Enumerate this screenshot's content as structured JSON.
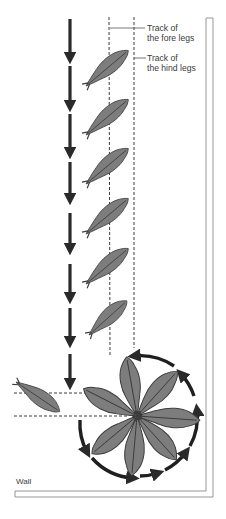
{
  "diagram": {
    "type": "lizard-locomotion-tracks",
    "labels": {
      "fore_track_line1": "Track of",
      "fore_track_line2": "the fore legs",
      "hind_track_line1": "Track of",
      "hind_track_line2": "the hind legs",
      "wall": "Wall"
    },
    "colors": {
      "lizard_fill": "#7d7d7d",
      "lizard_outline": "#3c3c3c",
      "arrow": "#2a2a2a",
      "dashed_line": "#3a3a3a",
      "wall_line": "#8a8a8a",
      "background": "#ffffff"
    },
    "elements": {
      "straight_path_lizards": 6,
      "rosette_lizards": 7,
      "entering_lizard": 1,
      "direction_arrows_column": 8,
      "circular_arrow_segments": 8
    },
    "icons": {
      "lizard": "lizard-silhouette",
      "arrow": "arrow-down",
      "circle_arrow": "clockwise-arc-arrow"
    }
  }
}
